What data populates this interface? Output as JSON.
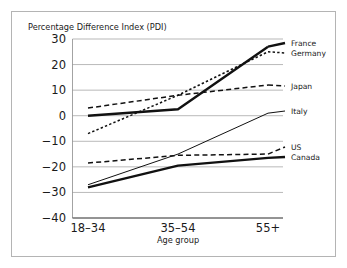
{
  "figure": {
    "border_color": "#b4b4b4",
    "background": "#ffffff"
  },
  "chart_data": {
    "type": "line",
    "title": "",
    "ylabel": "Percentage Difference Index (PDI)",
    "xlabel": "Age group",
    "categories": [
      "18–34",
      "35–54",
      "55+"
    ],
    "ylim": [
      -40,
      30
    ],
    "yticks": [
      30,
      20,
      10,
      0,
      -10,
      -20,
      -30,
      -40
    ],
    "ytick_labels": [
      "30",
      "20",
      "10",
      "0",
      "−10",
      "−20",
      "−30",
      "−40"
    ],
    "grid": "horizontal",
    "legend_position": "right-edge-labels",
    "series": [
      {
        "name": "France",
        "values": [
          0,
          2.5,
          27
        ],
        "style": "solid",
        "width": "thick",
        "color": "#111111",
        "label_x": 291,
        "label_y": 46
      },
      {
        "name": "Germany",
        "values": [
          -7,
          8,
          25
        ],
        "style": "dotted",
        "width": "med",
        "color": "#111111",
        "label_x": 291,
        "label_y": 56
      },
      {
        "name": "Japan",
        "values": [
          3,
          8,
          12
        ],
        "style": "dashed",
        "width": "med",
        "color": "#111111",
        "label_x": 291,
        "label_y": 89
      },
      {
        "name": "Italy",
        "values": [
          -27,
          -15,
          1
        ],
        "style": "solid",
        "width": "thin",
        "color": "#111111",
        "label_x": 291,
        "label_y": 114
      },
      {
        "name": "US",
        "values": [
          -18.5,
          -15.5,
          -15
        ],
        "style": "dashed",
        "width": "med",
        "color": "#111111",
        "label_x": 291,
        "label_y": 150
      },
      {
        "name": "Canada",
        "values": [
          -28,
          -19.5,
          -16.5
        ],
        "style": "solid",
        "width": "thick",
        "color": "#111111",
        "label_x": 291,
        "label_y": 160
      }
    ]
  }
}
